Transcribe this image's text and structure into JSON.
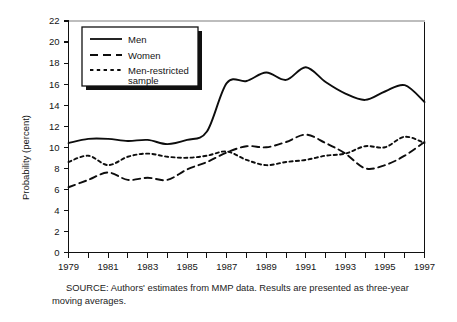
{
  "figure": {
    "caption": "SOURCE:  Authors' estimates from MMP data.  Results are presented as three-year moving averages.",
    "caption_line1": "SOURCE:  Authors' estimates from MMP data.  Results are presented as",
    "caption_line2": "three-year moving averages."
  },
  "chart_data": {
    "type": "line",
    "title": "",
    "xlabel": "",
    "ylabel": "Probability (percent)",
    "xlim": [
      1979,
      1997
    ],
    "ylim": [
      0,
      22
    ],
    "ytick_step": 2,
    "yticks": [
      0,
      2,
      4,
      6,
      8,
      10,
      12,
      14,
      16,
      18,
      20,
      22
    ],
    "ytick_labels": [
      "0",
      "2",
      "4",
      "6",
      "8",
      "10",
      "12",
      "14",
      "16",
      "18",
      "20",
      "22"
    ],
    "xticks": [
      1979,
      1980,
      1981,
      1982,
      1983,
      1984,
      1985,
      1986,
      1987,
      1988,
      1989,
      1990,
      1991,
      1992,
      1993,
      1994,
      1995,
      1996,
      1997
    ],
    "xtick_labels": [
      "1979",
      "",
      "1981",
      "",
      "1983",
      "",
      "1985",
      "",
      "1987",
      "",
      "1989",
      "",
      "1991",
      "",
      "1993",
      "",
      "1995",
      "",
      "1997"
    ],
    "xtick_labels_shown": [
      "1979",
      "1981",
      "1983",
      "1985",
      "1987",
      "1989",
      "1991",
      "1993",
      "1995",
      "1997"
    ],
    "grid": false,
    "legend_position": "upper-left",
    "x": [
      1979,
      1980,
      1981,
      1982,
      1983,
      1984,
      1985,
      1986,
      1987,
      1988,
      1989,
      1990,
      1991,
      1992,
      1993,
      1994,
      1995,
      1996,
      1997
    ],
    "series": [
      {
        "name": "Men",
        "style": "solid",
        "color": "#0d0d0d",
        "values": [
          10.4,
          10.8,
          10.8,
          10.6,
          10.7,
          10.3,
          10.7,
          11.5,
          16.1,
          16.3,
          17.1,
          16.4,
          17.6,
          16.2,
          15.1,
          14.5,
          15.3,
          15.9,
          14.3
        ]
      },
      {
        "name": "Women",
        "style": "long-dash",
        "color": "#0d0d0d",
        "values": [
          6.2,
          6.9,
          7.6,
          6.9,
          7.1,
          6.9,
          7.9,
          8.6,
          9.5,
          10.1,
          10.0,
          10.5,
          11.2,
          10.4,
          9.4,
          8.0,
          8.3,
          9.2,
          10.5
        ]
      },
      {
        "name": "Men-restricted sample",
        "style": "short-dash",
        "color": "#0d0d0d",
        "values": [
          8.6,
          9.2,
          8.3,
          9.1,
          9.4,
          9.1,
          9.0,
          9.2,
          9.6,
          8.8,
          8.3,
          8.6,
          8.8,
          9.2,
          9.4,
          10.1,
          10.0,
          11.0,
          10.4
        ]
      }
    ],
    "legend_entries": [
      {
        "label": "Men",
        "style": "solid"
      },
      {
        "label": "Women",
        "style": "long-dash"
      },
      {
        "label": "Men-restricted",
        "label2": "sample",
        "style": "short-dash"
      }
    ]
  }
}
